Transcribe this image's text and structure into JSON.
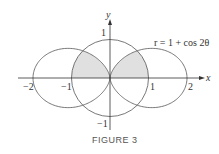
{
  "figure": {
    "caption": "FIGURE 3",
    "equation": "r = 1 + cos 2θ",
    "x_axis_label": "x",
    "y_axis_label": "y",
    "x_ticks": [
      {
        "label": "−2",
        "value": -2
      },
      {
        "label": "−1",
        "value": -1
      },
      {
        "label": "1",
        "value": 1
      },
      {
        "label": "2",
        "value": 2
      }
    ],
    "y_ticks": [
      {
        "label": "1",
        "value": 1
      },
      {
        "label": "−1",
        "value": -1
      }
    ],
    "curves": [
      {
        "name": "circle",
        "equation": "r = 1"
      },
      {
        "name": "polar-curve",
        "equation": "r = 1 + cos 2θ"
      }
    ],
    "shading_color": "#e0e0e0",
    "line_color": "#555555"
  }
}
